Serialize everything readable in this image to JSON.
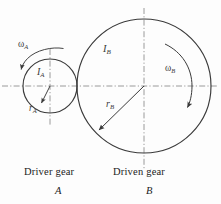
{
  "figure": {
    "background_color": "#fdfdfd",
    "line_color": "#3a3a3a",
    "centerline_color": "#8a8a8a",
    "text_color": "#222222"
  },
  "gear_a": {
    "name": "Driver gear",
    "letter": "A",
    "inertia_symbol": "I",
    "inertia_subscript": "A",
    "radius_symbol": "r",
    "radius_subscript": "A",
    "omega_symbol": "ω",
    "omega_subscript": "A",
    "center_x": 50,
    "center_y": 86,
    "radius": 27,
    "rotation_direction": "counterclockwise"
  },
  "gear_b": {
    "name": "Driven gear",
    "letter": "B",
    "inertia_symbol": "I",
    "inertia_subscript": "B",
    "radius_symbol": "r",
    "radius_subscript": "B",
    "omega_symbol": "ω",
    "omega_subscript": "B",
    "center_x": 144,
    "center_y": 86,
    "radius": 67,
    "rotation_direction": "clockwise"
  },
  "captions": {
    "driver_gear": "Driver gear",
    "driver_letter": "A",
    "driven_gear": "Driven gear",
    "driven_letter": "B"
  }
}
